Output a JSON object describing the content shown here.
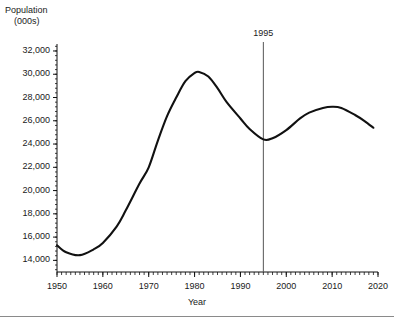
{
  "chart_data": {
    "type": "line",
    "title": "",
    "ylabel": "Population",
    "ylabel_units": "(000s)",
    "xlabel": "Year",
    "xlim": [
      1950,
      2020
    ],
    "ylim": [
      13000,
      32600
    ],
    "grid": false,
    "legend": "none",
    "yticks": [
      14000,
      16000,
      18000,
      20000,
      22000,
      24000,
      26000,
      28000,
      30000,
      32000
    ],
    "ytick_labels": [
      "14,000",
      "16,000",
      "18,000",
      "20,000",
      "22,000",
      "24,000",
      "26,000",
      "28,000",
      "30,000",
      "32,000"
    ],
    "xticks": [
      1950,
      1960,
      1970,
      1980,
      1990,
      2000,
      2010,
      2020
    ],
    "xtick_labels": [
      "1950",
      "1960",
      "1970",
      "1980",
      "1990",
      "2000",
      "2010",
      "2020"
    ],
    "x_minor_tick_step": 1,
    "y_minor_ticks_per_interval": 4,
    "line_color": "#111111",
    "annotations": [
      {
        "name": "1995-marker",
        "label": "1995",
        "x": 1995,
        "type": "vertical-line",
        "color": "#555555"
      }
    ],
    "x": [
      1950,
      1952,
      1955,
      1958,
      1960,
      1963,
      1965,
      1968,
      1970,
      1972,
      1974,
      1976,
      1978,
      1980,
      1981,
      1983,
      1985,
      1987,
      1990,
      1992,
      1995,
      1997,
      2000,
      2003,
      2005,
      2008,
      2010,
      2012,
      2015,
      2017,
      2019
    ],
    "y": [
      15300,
      14700,
      14450,
      14950,
      15500,
      16900,
      18300,
      20600,
      22000,
      24300,
      26400,
      28000,
      29400,
      30100,
      30200,
      29800,
      28800,
      27600,
      26200,
      25300,
      24400,
      24500,
      25200,
      26200,
      26700,
      27100,
      27200,
      27100,
      26500,
      26000,
      25400
    ]
  }
}
